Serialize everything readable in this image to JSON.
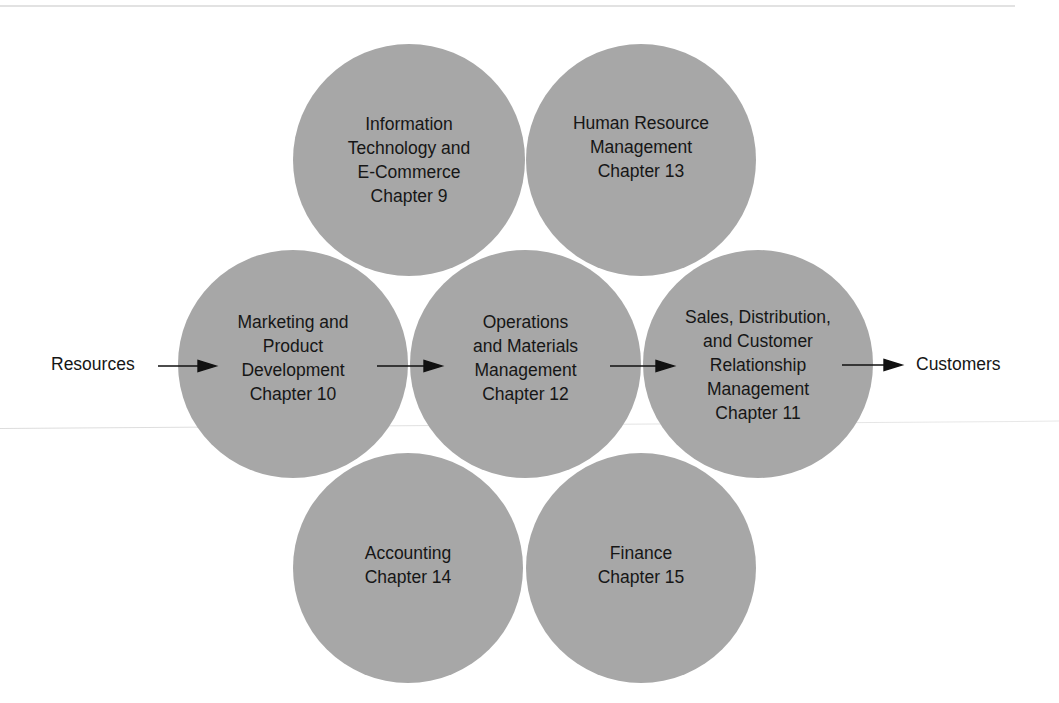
{
  "diagram": {
    "fill_color": "#a7a7a7",
    "text_color": "#161616",
    "nodes": [
      {
        "id": "it",
        "lines": [
          "Information",
          "Technology and",
          "E-Commerce",
          "Chapter 9"
        ],
        "cx": 409,
        "cy": 160
      },
      {
        "id": "hr",
        "lines": [
          "Human Resource",
          "Management",
          "Chapter 13"
        ],
        "cx": 641,
        "cy": 160
      },
      {
        "id": "marketing",
        "lines": [
          "Marketing and",
          "Product",
          "Development",
          "Chapter 10"
        ],
        "cx": 293,
        "cy": 364
      },
      {
        "id": "operations",
        "lines": [
          "Operations",
          "and Materials",
          "Management",
          "Chapter 12"
        ],
        "cx": 526,
        "cy": 364
      },
      {
        "id": "sales",
        "lines": [
          "Sales, Distribution,",
          "and Customer",
          "Relationship",
          "Management",
          "Chapter 11"
        ],
        "cx": 758,
        "cy": 364
      },
      {
        "id": "accounting",
        "lines": [
          "Accounting",
          "Chapter 14"
        ],
        "cx": 409,
        "cy": 562
      },
      {
        "id": "finance",
        "lines": [
          "Finance",
          "Chapter 15"
        ],
        "cx": 641,
        "cy": 562
      }
    ],
    "flow": {
      "input_label": "Resources",
      "output_label": "Customers"
    },
    "edges": [
      {
        "from": "Resources",
        "to": "marketing"
      },
      {
        "from": "marketing",
        "to": "operations"
      },
      {
        "from": "operations",
        "to": "sales"
      },
      {
        "from": "sales",
        "to": "Customers"
      }
    ]
  }
}
